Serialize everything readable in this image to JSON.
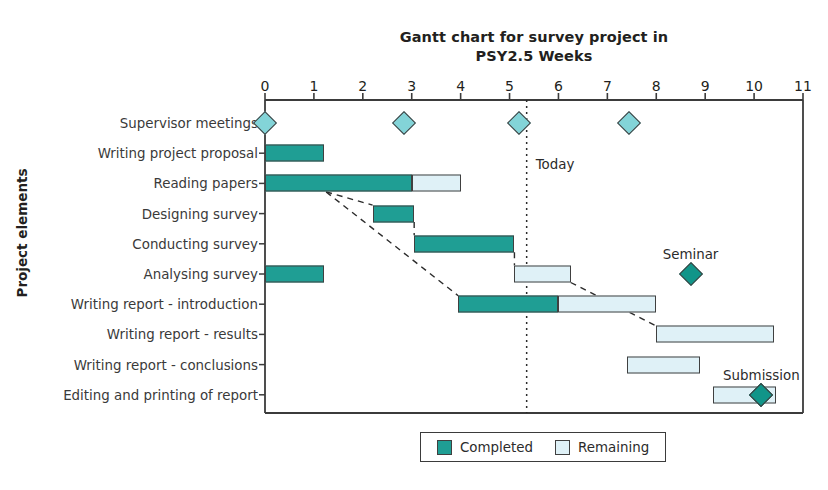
{
  "chart_data": {
    "type": "bar",
    "chart_subtype": "gantt",
    "title": "Gantt chart for survey project in PSY2.5 Weeks",
    "title_lines": [
      "Gantt chart for survey project in",
      "PSY2.5 Weeks"
    ],
    "xlabel": "",
    "ylabel": "Project elements",
    "xlim": [
      0,
      11
    ],
    "xticks": [
      0,
      1,
      2,
      3,
      4,
      5,
      6,
      7,
      8,
      9,
      10,
      11
    ],
    "xtick_labels": [
      "0",
      "1",
      "2",
      "3",
      "4",
      "5",
      "6",
      "7",
      "8",
      "9",
      "10",
      "11"
    ],
    "grid": false,
    "legend_position": "bottom-center",
    "colors": {
      "completed": "#1f9e94",
      "remaining": "#dff1f7",
      "milestone_light": "#83d4d8",
      "milestone_dark": "#119589",
      "outline": "#404040",
      "text": "#231f20",
      "background": "#ffffff"
    },
    "categories": [
      "Supervisor meetings",
      "Writing project proposal",
      "Reading papers",
      "Designing survey",
      "Conducting survey",
      "Analysing survey",
      "Writing report - introduction",
      "Writing report - results",
      "Writing report - conclusions",
      "Editing and printing of report"
    ],
    "tasks": [
      {
        "name": "Supervisor meetings",
        "row": 0,
        "bars": [],
        "milestones": [
          {
            "week": 0.0,
            "style": "light"
          },
          {
            "week": 2.85,
            "style": "light"
          },
          {
            "week": 5.2,
            "style": "light"
          },
          {
            "week": 7.45,
            "style": "light"
          }
        ]
      },
      {
        "name": "Writing project proposal",
        "row": 1,
        "bars": [
          {
            "status": "Completed",
            "start": 0.0,
            "end": 1.2
          }
        ],
        "milestones": []
      },
      {
        "name": "Reading papers",
        "row": 2,
        "bars": [
          {
            "status": "Completed",
            "start": 0.0,
            "end": 3.0
          },
          {
            "status": "Remaining",
            "start": 3.0,
            "end": 4.0
          }
        ],
        "milestones": []
      },
      {
        "name": "Designing survey",
        "row": 3,
        "bars": [
          {
            "status": "Completed",
            "start": 2.2,
            "end": 3.05
          }
        ],
        "milestones": []
      },
      {
        "name": "Conducting survey",
        "row": 4,
        "bars": [
          {
            "status": "Completed",
            "start": 3.05,
            "end": 5.1
          }
        ],
        "milestones": []
      },
      {
        "name": "Analysing survey",
        "row": 5,
        "bars": [
          {
            "status": "Completed",
            "start": 0.0,
            "end": 1.2
          },
          {
            "status": "Remaining",
            "start": 5.1,
            "end": 6.25
          }
        ],
        "milestones": []
      },
      {
        "name": "Writing report - introduction",
        "row": 6,
        "bars": [
          {
            "status": "Completed",
            "start": 3.95,
            "end": 6.0
          },
          {
            "status": "Remaining",
            "start": 6.0,
            "end": 8.0
          }
        ],
        "milestones": []
      },
      {
        "name": "Writing report - results",
        "row": 7,
        "bars": [
          {
            "status": "Remaining",
            "start": 8.0,
            "end": 10.4
          }
        ],
        "milestones": []
      },
      {
        "name": "Writing report - conclusions",
        "row": 8,
        "bars": [
          {
            "status": "Remaining",
            "start": 7.4,
            "end": 8.9
          }
        ],
        "milestones": []
      },
      {
        "name": "Editing and printing of report",
        "row": 9,
        "bars": [
          {
            "status": "Remaining",
            "start": 9.15,
            "end": 10.45
          }
        ],
        "milestones": [
          {
            "week": 10.15,
            "style": "dark"
          }
        ]
      }
    ],
    "annotations": [
      {
        "label": "Today",
        "type": "vertical-line",
        "week": 5.35,
        "line_style": "dotted"
      },
      {
        "label": "Seminar",
        "type": "milestone-label",
        "week": 8.7,
        "row": 5,
        "style": "dark"
      },
      {
        "label": "Submission",
        "type": "milestone-label",
        "week": 10.15,
        "row": 9,
        "style": "dark"
      }
    ],
    "dependencies": [
      {
        "from_week": 1.25,
        "from_row": 2,
        "to_week": 2.2,
        "to_row": 3
      },
      {
        "from_week": 3.05,
        "from_row": 3,
        "to_week": 3.05,
        "to_row": 4
      },
      {
        "from_week": 5.1,
        "from_row": 4,
        "to_week": 5.1,
        "to_row": 5
      },
      {
        "from_week": 1.25,
        "from_row": 2,
        "to_week": 3.95,
        "to_row": 6
      },
      {
        "from_week": 6.25,
        "from_row": 5,
        "to_week": 8.0,
        "to_row": 7
      }
    ],
    "legend": {
      "items": [
        {
          "label": "Completed",
          "color_key": "completed"
        },
        {
          "label": "Remaining",
          "color_key": "remaining"
        }
      ]
    }
  }
}
